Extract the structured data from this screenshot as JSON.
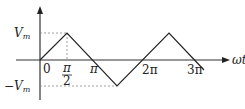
{
  "diagram": {
    "type": "triangular-wave",
    "axes": {
      "x_label": "ωt",
      "y_arrow": true
    },
    "y_ticks": {
      "max": "V",
      "max_sub": "m",
      "min": "−V",
      "min_sub": "m"
    },
    "x_ticks": {
      "origin": "0",
      "half_pi_num": "π",
      "half_pi_den": "2",
      "pi": "π",
      "two_pi": "2π",
      "three_pi": "3π"
    },
    "colors": {
      "line": "#222222",
      "guide": "#888888",
      "background": "#ffffff"
    }
  }
}
